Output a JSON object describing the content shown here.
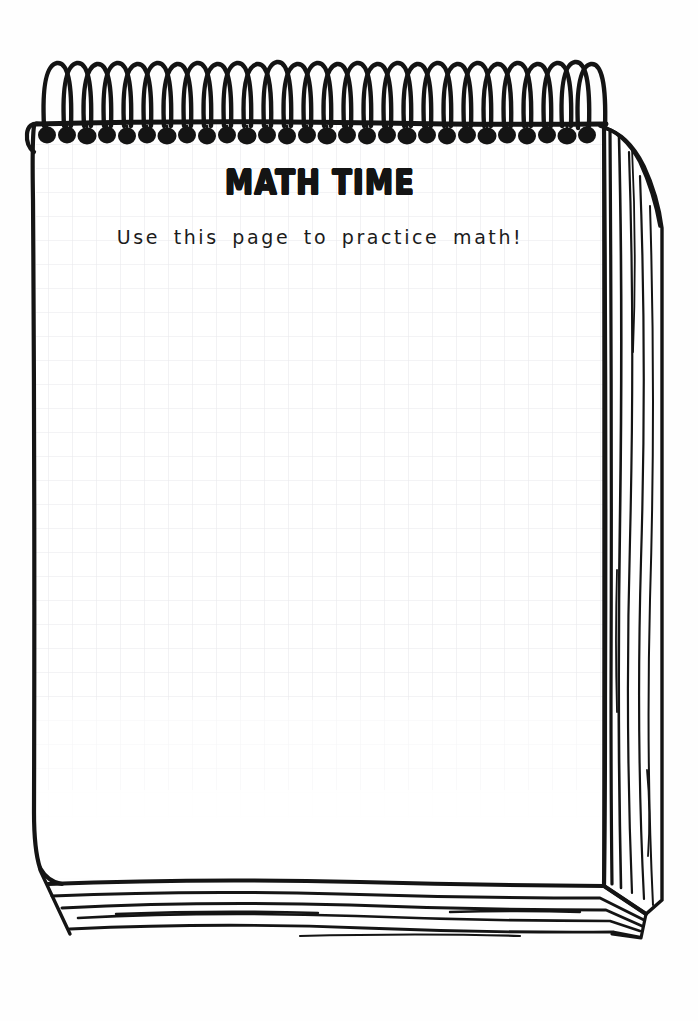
{
  "document": {
    "kind": "spiral-notepad-worksheet",
    "title": "MATH TIME",
    "subtitle": "Use this page to practice math!",
    "paper_style": "graph-grid",
    "orientation": "portrait"
  },
  "colors": {
    "ink": "#141414",
    "page": "#ffffff",
    "canvas": "#fefefe",
    "grid_line": "#e9e9ec",
    "shadow": "#f2f2f2"
  },
  "binding": {
    "type": "spiral-wire",
    "loop_count": 29,
    "hole_count": 29,
    "label": "spiral binding"
  },
  "page_stack": {
    "right_edge_lines": 7,
    "bottom_edge_lines": 6,
    "label": "stacked pages"
  },
  "grid": {
    "cell_size_px": 24,
    "visible": true
  },
  "writing_area": {
    "label": "blank work space",
    "placeholder": ""
  }
}
